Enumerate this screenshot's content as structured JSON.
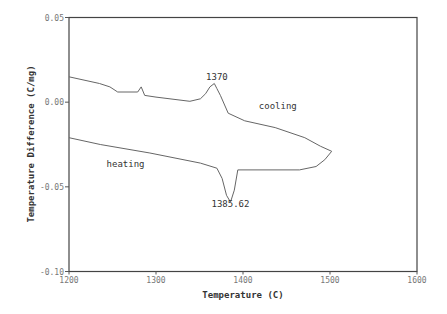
{
  "chart_data": {
    "type": "line",
    "title": "",
    "xlabel": "Temperature (C)",
    "ylabel": "Temperature Difference (C/mg)",
    "xlim": [
      1200,
      1600
    ],
    "ylim": [
      -0.1,
      0.05
    ],
    "xticks": [
      1200,
      1300,
      1400,
      1500,
      1600
    ],
    "xtick_labels": [
      "1200",
      "1300",
      "1400",
      "1500",
      "1600"
    ],
    "yticks": [
      0.05,
      0.0,
      -0.05,
      -0.1
    ],
    "ytick_labels": [
      "0.05",
      "0.00",
      "-0.05",
      "-0.10"
    ],
    "grid": false,
    "legend": null,
    "series": [
      {
        "name": "cooling",
        "x": [
          1200,
          1235,
          1247,
          1256,
          1279,
          1283,
          1287,
          1300,
          1339,
          1351,
          1357,
          1362,
          1367,
          1370,
          1374,
          1383,
          1402,
          1437,
          1471,
          1489,
          1502
        ],
        "y": [
          0.015,
          0.011,
          0.009,
          0.006,
          0.006,
          0.009,
          0.004,
          0.003,
          0.0005,
          0.002,
          0.005,
          0.009,
          0.011,
          0.008,
          0.004,
          -0.0065,
          -0.011,
          -0.015,
          -0.021,
          -0.026,
          -0.029
        ]
      },
      {
        "name": "heating",
        "x": [
          1200,
          1236,
          1293,
          1351,
          1370,
          1376,
          1381,
          1385.62,
          1390,
          1394,
          1400,
          1465,
          1484,
          1494,
          1502
        ],
        "y": [
          -0.021,
          -0.025,
          -0.03,
          -0.036,
          -0.039,
          -0.045,
          -0.055,
          -0.059,
          -0.052,
          -0.04,
          -0.04,
          -0.04,
          -0.038,
          -0.034,
          -0.029
        ]
      }
    ],
    "annotations": [
      {
        "text": "1370",
        "x": 1370,
        "y": 0.013
      },
      {
        "text": "cooling",
        "x": 1440,
        "y": -0.004
      },
      {
        "text": "heating",
        "x": 1265,
        "y": -0.038
      },
      {
        "text": "1385.62",
        "x": 1385.62,
        "y": -0.062
      }
    ]
  },
  "labels": {
    "xlabel": "Temperature (C)",
    "ylabel": "Temperature Difference (C/mg)",
    "peak_cooling": "1370",
    "peak_heating": "1385.62",
    "cooling": "cooling",
    "heating": "heating"
  }
}
